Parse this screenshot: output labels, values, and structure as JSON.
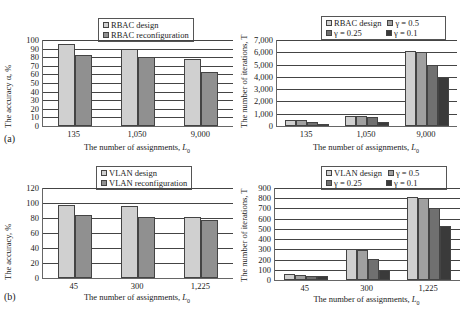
{
  "chart_data": [
    {
      "id": "a-left",
      "type": "bar",
      "panel_label": "(a)",
      "title": "",
      "xlabel": "The number of assignments, L0",
      "ylabel": "The accuracy α, %",
      "categories": [
        "135",
        "1,050",
        "9,000"
      ],
      "series": [
        {
          "name": "RBAC design",
          "color": "#d0d0d0",
          "values": [
            95,
            90,
            78
          ]
        },
        {
          "name": "RBAC reconfiguration",
          "color": "#909090",
          "values": [
            82,
            80,
            63
          ]
        }
      ],
      "ylim": [
        0,
        100
      ],
      "yticks": [
        0,
        10,
        20,
        30,
        40,
        50,
        60,
        70,
        80,
        90,
        100
      ],
      "grid": true,
      "legend_position": "top"
    },
    {
      "id": "a-right",
      "type": "bar",
      "title": "",
      "xlabel": "The number of assignments, L0",
      "ylabel": "The number of iterations, T",
      "categories": [
        "135",
        "1,050",
        "9,000"
      ],
      "series": [
        {
          "name": "RBAC design",
          "color": "#d0d0d0",
          "values": [
            500,
            850,
            6100
          ]
        },
        {
          "name": "γ = 0.5",
          "color": "#a0a0a0",
          "values": [
            450,
            800,
            6000
          ]
        },
        {
          "name": "γ = 0.25",
          "color": "#707070",
          "values": [
            300,
            700,
            5000
          ]
        },
        {
          "name": "γ = 0.1",
          "color": "#3a3a3a",
          "values": [
            150,
            300,
            4000
          ]
        }
      ],
      "ylim": [
        0,
        7000
      ],
      "yticks": [
        "0",
        "1,000",
        "2,000",
        "3,000",
        "4,000",
        "5,000",
        "6,000",
        "7,000"
      ],
      "grid": true,
      "legend_position": "top"
    },
    {
      "id": "b-left",
      "type": "bar",
      "panel_label": "(b)",
      "title": "",
      "xlabel": "The number of assignments, L0",
      "ylabel": "The accuracy, %",
      "categories": [
        "45",
        "300",
        "1,225"
      ],
      "series": [
        {
          "name": "VLAN design",
          "color": "#d0d0d0",
          "values": [
            98,
            96,
            81
          ]
        },
        {
          "name": "VLAN reconfiguration",
          "color": "#909090",
          "values": [
            84,
            82,
            77
          ]
        }
      ],
      "ylim": [
        0,
        120
      ],
      "yticks": [
        0,
        20,
        40,
        60,
        80,
        100,
        120
      ],
      "grid": true,
      "legend_position": "top"
    },
    {
      "id": "b-right",
      "type": "bar",
      "title": "",
      "xlabel": "The number of assignments, L0",
      "ylabel": "The number of iterations, T",
      "categories": [
        "45",
        "300",
        "1,225"
      ],
      "series": [
        {
          "name": "VLAN design",
          "color": "#d0d0d0",
          "values": [
            55,
            300,
            810
          ]
        },
        {
          "name": "γ = 0.5",
          "color": "#a0a0a0",
          "values": [
            50,
            295,
            800
          ]
        },
        {
          "name": "γ = 0.25",
          "color": "#707070",
          "values": [
            40,
            205,
            705
          ]
        },
        {
          "name": "γ = 0.1",
          "color": "#3a3a3a",
          "values": [
            35,
            100,
            530
          ]
        }
      ],
      "ylim": [
        0,
        900
      ],
      "yticks": [
        0,
        100,
        200,
        300,
        400,
        500,
        600,
        700,
        800,
        900
      ],
      "grid": true,
      "legend_position": "top"
    }
  ],
  "labels": {
    "panel_a": "(a)",
    "panel_b": "(b)",
    "xlabel_prefix": "The number of assignments, ",
    "xlabel_var": "L",
    "xlabel_sub": "0"
  }
}
